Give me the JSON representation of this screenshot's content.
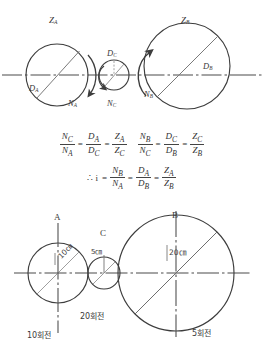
{
  "figure": {
    "title_top": "Gear train schematic with gear ratio relations",
    "top_diagram": {
      "name": "top-gear-train",
      "circles": [
        {
          "id": "A",
          "label": "Z",
          "sub": "A",
          "diameter_label": "D",
          "diameter_sub": "A",
          "speed_label": "N",
          "speed_sub": "A",
          "cx": 57,
          "cy": 75,
          "r": 31,
          "rotation": "clockwise"
        },
        {
          "id": "C",
          "label": "",
          "sub": "",
          "diameter_label": "D",
          "diameter_sub": "C",
          "speed_label": "N",
          "speed_sub": "C",
          "cx": 114,
          "cy": 75,
          "r": 15,
          "rotation": "counterclockwise"
        },
        {
          "id": "B",
          "label": "Z",
          "sub": "B",
          "diameter_label": "D",
          "diameter_sub": "B",
          "speed_label": "N",
          "speed_sub": "B",
          "cx": 187,
          "cy": 66,
          "r": 43,
          "rotation": "counterclockwise"
        }
      ],
      "labels": {
        "za": "Z",
        "za_sub": "A",
        "zb": "Z",
        "zb_sub": "B",
        "da": "D",
        "da_sub": "A",
        "dc": "D",
        "dc_sub": "C",
        "db": "D",
        "db_sub": "B",
        "na": "N",
        "na_sub": "A",
        "nc": "N",
        "nc_sub": "C",
        "nb": "N",
        "nb_sub": "B"
      }
    },
    "equations": {
      "line1": [
        {
          "num": "N",
          "num_sub": "C",
          "den": "N",
          "den_sub": "A"
        },
        {
          "op": "="
        },
        {
          "num": "D",
          "num_sub": "A",
          "den": "D",
          "den_sub": "C"
        },
        {
          "op": "="
        },
        {
          "num": "Z",
          "num_sub": "A",
          "den": "Z",
          "den_sub": "C"
        },
        {
          "gap": true
        },
        {
          "num": "N",
          "num_sub": "B",
          "den": "N",
          "den_sub": "C"
        },
        {
          "op": "="
        },
        {
          "num": "D",
          "num_sub": "C",
          "den": "D",
          "den_sub": "B"
        },
        {
          "op": "="
        },
        {
          "num": "Z",
          "num_sub": "C",
          "den": "Z",
          "den_sub": "B"
        }
      ],
      "line2_prefix": "∴ i",
      "line2": [
        {
          "num": "N",
          "num_sub": "B",
          "den": "N",
          "den_sub": "A"
        },
        {
          "op": "="
        },
        {
          "num": "D",
          "num_sub": "A",
          "den": "D",
          "den_sub": "B"
        },
        {
          "op": "="
        },
        {
          "num": "Z",
          "num_sub": "A",
          "den": "Z",
          "den_sub": "B"
        }
      ]
    },
    "bottom_diagram": {
      "name": "bottom-pulley-train",
      "pulleys": [
        {
          "id": "A",
          "title": "A",
          "size_label": "10㎝",
          "rotations_label": "10회전",
          "cx": 58,
          "cy": 273,
          "r": 30
        },
        {
          "id": "C",
          "title": "C",
          "size_label": "5㎝",
          "rotations_label": "20회전",
          "cx": 104,
          "cy": 273,
          "r": 16
        },
        {
          "id": "B",
          "title": "B",
          "size_label": "20㎝",
          "rotations_label": "5회전",
          "cx": 176,
          "cy": 273,
          "r": 58
        }
      ]
    }
  },
  "colors": {
    "line": "#3d3d3d",
    "diagonal": "#6e6e6e",
    "text": "#333333",
    "background": "#ffffff"
  }
}
